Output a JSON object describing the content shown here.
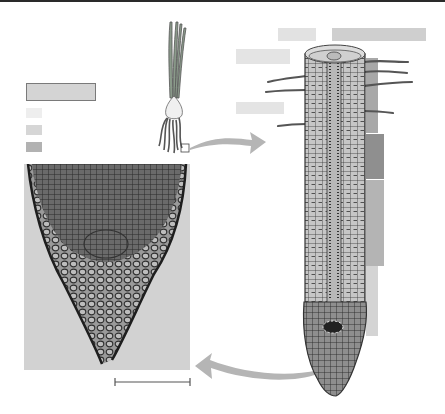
{
  "figure": {
    "panels": [
      "whole onion plant with roots",
      "longitudinal section drawing of root",
      "micrograph of root tip"
    ]
  },
  "legend": {
    "title_box": {
      "x": 26,
      "y": 83,
      "w": 68,
      "h": 16,
      "color": "#d4d4d4",
      "border": "#7a7a7a"
    },
    "swatches": [
      {
        "x": 26,
        "y": 108,
        "w": 16,
        "h": 10,
        "color": "#eeeeee"
      },
      {
        "x": 26,
        "y": 125,
        "w": 16,
        "h": 10,
        "color": "#d6d6d6"
      },
      {
        "x": 26,
        "y": 142,
        "w": 16,
        "h": 10,
        "color": "#b2b2b2"
      }
    ]
  },
  "labels": [
    {
      "x": 278,
      "y": 28,
      "w": 38,
      "h": 13,
      "color": "#e2e2e2"
    },
    {
      "x": 332,
      "y": 28,
      "w": 94,
      "h": 13,
      "color": "#cfcfcf"
    },
    {
      "x": 236,
      "y": 49,
      "w": 54,
      "h": 15,
      "color": "#e4e4e4"
    },
    {
      "x": 236,
      "y": 102,
      "w": 48,
      "h": 12,
      "color": "#e4e4e4"
    }
  ],
  "zone_bars": [
    {
      "x": 366,
      "y": 58,
      "w": 12,
      "h": 75,
      "color": "#a8a8a8"
    },
    {
      "x": 366,
      "y": 134,
      "w": 18,
      "h": 45,
      "color": "#8f8f8f"
    },
    {
      "x": 366,
      "y": 180,
      "w": 18,
      "h": 86,
      "color": "#b4b4b4"
    },
    {
      "x": 366,
      "y": 266,
      "w": 12,
      "h": 70,
      "color": "#d4d4d4"
    }
  ],
  "scale_bar": {
    "x1": 115,
    "x2": 190,
    "y": 382
  }
}
